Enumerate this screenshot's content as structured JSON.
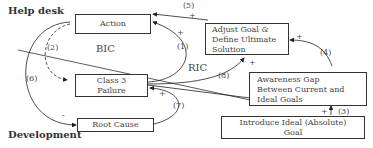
{
  "regions": {
    "top": "Help desk",
    "bottom": "Development"
  },
  "nodes": {
    "action": "Action",
    "class3": [
      "Class 3",
      "Failure"
    ],
    "root_cause": "Root Cause",
    "adjust": [
      "Adjust Goal &",
      "Define Ultimate",
      "Solution"
    ],
    "awareness": [
      "Awareness Gap",
      "Between Current and",
      "Ideal Goals"
    ],
    "introduce": [
      "Introduce Ideal (Absolute)",
      "Goal"
    ]
  },
  "loops": {
    "bic": "BIC",
    "ric": "RIC"
  },
  "links": [
    "(1)",
    "(2)",
    "(3)",
    "(4)",
    "(5)",
    "(6)",
    "(7)",
    "(8)"
  ],
  "signs": {
    "plus": "+",
    "minus": "-"
  }
}
